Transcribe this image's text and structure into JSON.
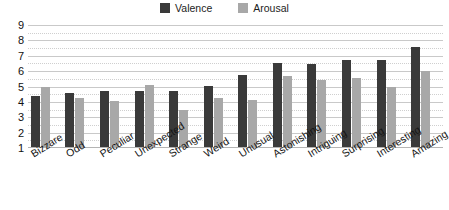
{
  "chart_data": {
    "type": "bar",
    "title": "",
    "xlabel": "",
    "ylabel": "",
    "ylim": [
      1,
      9
    ],
    "yticks": [
      "1",
      "2",
      "3",
      "4",
      "5",
      "6",
      "7",
      "8",
      "9"
    ],
    "grid": true,
    "legend_position": "top-center",
    "categories": [
      "Bizzare",
      "Odd",
      "Peculiar",
      "Unexpected",
      "Strange",
      "Weird",
      "Unusual",
      "Astonishing",
      "Intriguing",
      "Surprising",
      "Interesting",
      "Amazing"
    ],
    "series": [
      {
        "name": "Valence",
        "color": "#3a3a3a",
        "values": [
          4.4,
          4.55,
          4.7,
          4.7,
          4.7,
          5.05,
          5.75,
          6.5,
          6.45,
          6.7,
          6.7,
          7.6
        ]
      },
      {
        "name": "Arousal",
        "color": "#a8a8a8",
        "values": [
          5.0,
          4.25,
          4.05,
          5.1,
          3.5,
          4.25,
          4.1,
          5.7,
          5.4,
          5.55,
          5.0,
          6.0
        ]
      }
    ]
  },
  "legend": {
    "entries": [
      {
        "label": "Valence",
        "color": "#3a3a3a"
      },
      {
        "label": "Arousal",
        "color": "#a8a8a8"
      }
    ]
  }
}
